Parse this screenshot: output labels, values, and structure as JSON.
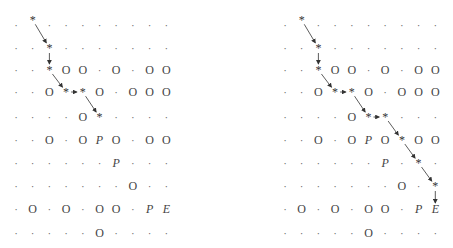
{
  "legend": {
    "dot": ".",
    "obstacle": "O",
    "pedestrian": "P",
    "exit": "E",
    "path": "*"
  },
  "grids": [
    {
      "name": "left-grid",
      "origin_x": 16,
      "col_step": 16.7,
      "rows_y": [
        25,
        48,
        70,
        92,
        117,
        140,
        163,
        186,
        209,
        233
      ],
      "cells": [
        [
          ".",
          "*",
          ".",
          ".",
          ".",
          ".",
          ".",
          ".",
          ".",
          "."
        ],
        [
          ".",
          ".",
          "*",
          ".",
          ".",
          ".",
          ".",
          ".",
          ".",
          "."
        ],
        [
          ".",
          ".",
          "*",
          "O",
          "O",
          ".",
          "O",
          ".",
          "O",
          "O"
        ],
        [
          ".",
          ".",
          "O",
          "*",
          "*",
          "O",
          ".",
          "O",
          "O",
          "O"
        ],
        [
          ".",
          ".",
          ".",
          ".",
          "O",
          "*",
          ".",
          ".",
          ".",
          "."
        ],
        [
          ".",
          ".",
          "O",
          ".",
          "O",
          "P",
          "O",
          ".",
          "O",
          "O"
        ],
        [
          ".",
          ".",
          ".",
          ".",
          ".",
          ".",
          "P",
          ".",
          ".",
          "."
        ],
        [
          ".",
          ".",
          ".",
          ".",
          ".",
          ".",
          ".",
          "O",
          ".",
          "."
        ],
        [
          ".",
          "O",
          ".",
          "O",
          ".",
          "O",
          "O",
          ".",
          "P",
          "E"
        ],
        [
          ".",
          ".",
          ".",
          ".",
          ".",
          "O",
          ".",
          ".",
          ".",
          "."
        ]
      ],
      "path": [
        [
          0,
          1
        ],
        [
          1,
          2
        ],
        [
          2,
          2
        ],
        [
          3,
          3
        ],
        [
          3,
          4
        ],
        [
          4,
          5
        ]
      ]
    },
    {
      "name": "right-grid",
      "origin_x": 285,
      "col_step": 16.7,
      "rows_y": [
        25,
        48,
        70,
        92,
        117,
        140,
        163,
        186,
        209,
        233
      ],
      "cells": [
        [
          ".",
          "*",
          ".",
          ".",
          ".",
          ".",
          ".",
          ".",
          ".",
          "."
        ],
        [
          ".",
          ".",
          "*",
          ".",
          ".",
          ".",
          ".",
          ".",
          ".",
          "."
        ],
        [
          ".",
          ".",
          "*",
          "O",
          "O",
          ".",
          "O",
          ".",
          "O",
          "O"
        ],
        [
          ".",
          ".",
          "O",
          "*",
          "*",
          "O",
          ".",
          "O",
          "O",
          "O"
        ],
        [
          ".",
          ".",
          ".",
          ".",
          "O",
          "*",
          "*",
          ".",
          ".",
          "."
        ],
        [
          ".",
          ".",
          "O",
          ".",
          "O",
          "P",
          "O",
          "*",
          "O",
          "O"
        ],
        [
          ".",
          ".",
          ".",
          ".",
          ".",
          ".",
          "P",
          ".",
          "*",
          "."
        ],
        [
          ".",
          ".",
          ".",
          ".",
          ".",
          ".",
          ".",
          "O",
          ".",
          "*"
        ],
        [
          ".",
          "O",
          ".",
          "O",
          ".",
          "O",
          "O",
          ".",
          "P",
          "E"
        ],
        [
          ".",
          ".",
          ".",
          ".",
          ".",
          "O",
          ".",
          ".",
          ".",
          "."
        ]
      ],
      "path": [
        [
          0,
          1
        ],
        [
          1,
          2
        ],
        [
          2,
          2
        ],
        [
          3,
          3
        ],
        [
          3,
          4
        ],
        [
          4,
          5
        ],
        [
          4,
          6
        ],
        [
          5,
          7
        ],
        [
          6,
          8
        ],
        [
          7,
          9
        ],
        [
          8,
          9
        ]
      ]
    }
  ]
}
